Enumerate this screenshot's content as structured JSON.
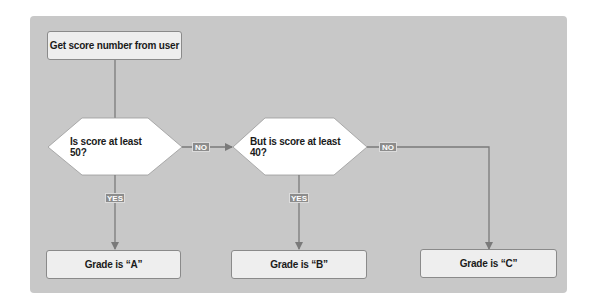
{
  "diagram": {
    "type": "flowchart",
    "nodes": {
      "start": {
        "label": "Get score number from user",
        "shape": "rectangle"
      },
      "decision1": {
        "label": "Is score at least 50?",
        "shape": "hexagon"
      },
      "decision2": {
        "label": "But is score at least 40?",
        "shape": "hexagon"
      },
      "grade_a": {
        "label": "Grade is “A”",
        "shape": "rectangle"
      },
      "grade_b": {
        "label": "Grade is “B”",
        "shape": "rectangle"
      },
      "grade_c": {
        "label": "Grade is “C”",
        "shape": "rectangle"
      }
    },
    "edges": {
      "d1_no": {
        "from": "decision1",
        "to": "decision2",
        "label": "NO"
      },
      "d1_yes": {
        "from": "decision1",
        "to": "grade_a",
        "label": "YES"
      },
      "d2_no": {
        "from": "decision2",
        "to": "grade_c",
        "label": "NO"
      },
      "d2_yes": {
        "from": "decision2",
        "to": "grade_b",
        "label": "YES"
      }
    },
    "colors": {
      "panel": "#c8c8c8",
      "box_fill": "#eeeeee",
      "diamond_fill": "#ffffff",
      "line": "#7a7a7a",
      "tag_fill": "#8c8c8c",
      "tag_text": "#ffffff"
    }
  }
}
